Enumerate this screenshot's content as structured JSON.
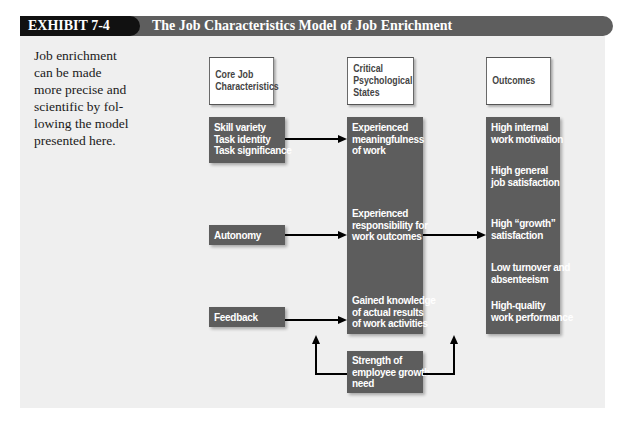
{
  "header": {
    "exhibit_label": "EXHIBIT 7-4",
    "title": "The Job Characteristics Model of Job Enrichment"
  },
  "intro": {
    "lines": [
      "Job enrichment",
      "can be made",
      "more precise and",
      "scientific by fol-",
      "lowing the model",
      "presented here."
    ]
  },
  "columns": {
    "core": {
      "heading_lines": [
        "Core Job",
        "Characteristics"
      ]
    },
    "critical": {
      "heading_lines": [
        "Critical",
        "Psychological",
        "States"
      ]
    },
    "outcomes": {
      "heading_lines": [
        "Outcomes"
      ]
    }
  },
  "core_items": {
    "group1": [
      "Skill variety",
      "Task identity",
      "Task significance"
    ],
    "autonomy": "Autonomy",
    "feedback": "Feedback"
  },
  "states": {
    "meaningfulness": [
      "Experienced",
      "meaningfulness",
      "of work"
    ],
    "responsibility": [
      "Experienced",
      "responsibility for",
      "work outcomes"
    ],
    "knowledge": [
      "Gained knowledge",
      "of actual results",
      "of work activities"
    ]
  },
  "outcomes": [
    [
      "High internal",
      "work motivation"
    ],
    [
      "High general",
      "job satisfaction"
    ],
    [
      "High “growth”",
      "satisfaction"
    ],
    [
      "Low turnover and",
      "absenteeism"
    ],
    [
      "High-quality",
      "work performance"
    ]
  ],
  "moderator": [
    "Strength of",
    "employee growth",
    "need"
  ],
  "colors": {
    "header_dark": "#111111",
    "header_bar": "#5e5e5e",
    "box_dark": "#5d5d5d",
    "panel_bg": "#efefef"
  }
}
